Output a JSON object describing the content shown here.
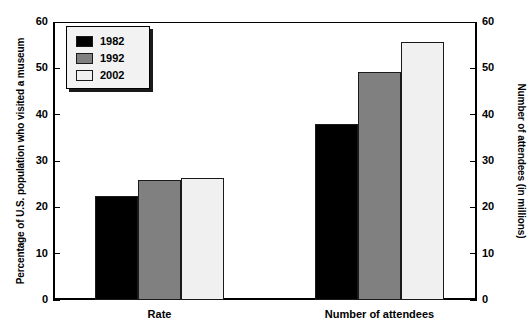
{
  "chart_data": {
    "type": "bar",
    "title": "",
    "categories": [
      "Rate",
      "Number of attendees"
    ],
    "series": [
      {
        "name": "1982",
        "color": "#000000",
        "values": [
          22.4,
          38.0
        ]
      },
      {
        "name": "1992",
        "color": "#808080",
        "values": [
          26.0,
          49.3
        ]
      },
      {
        "name": "2002",
        "color": "#f0f0f0",
        "values": [
          26.3,
          55.6
        ]
      }
    ],
    "xlabel": "",
    "ylabel": "Percentage of U.S. population who visited a museum",
    "y2label": "Number of attendees (in millions)",
    "ylim": [
      0,
      60
    ],
    "y2lim": [
      0,
      60
    ],
    "yticks": [
      "0",
      "10",
      "20",
      "30",
      "40",
      "50",
      "60"
    ],
    "y2ticks": [
      "0",
      "10",
      "20",
      "30",
      "40",
      "50",
      "60"
    ],
    "grid": false,
    "legend_position": "top-left"
  },
  "axes": {
    "left_title": "Percentage of U.S. population who visited a museum",
    "right_title": "Number of attendees (in millions)",
    "left_ticks": [
      "60",
      "50",
      "40",
      "30",
      "20",
      "10",
      "0"
    ],
    "right_ticks": [
      "60",
      "50",
      "40",
      "30",
      "20",
      "10",
      "0"
    ]
  },
  "legend": {
    "items": [
      {
        "label": "1982",
        "color": "#000000"
      },
      {
        "label": "1992",
        "color": "#808080"
      },
      {
        "label": "2002",
        "color": "#f0f0f0"
      }
    ]
  },
  "categories": [
    {
      "label": "Rate"
    },
    {
      "label": "Number of attendees"
    }
  ]
}
